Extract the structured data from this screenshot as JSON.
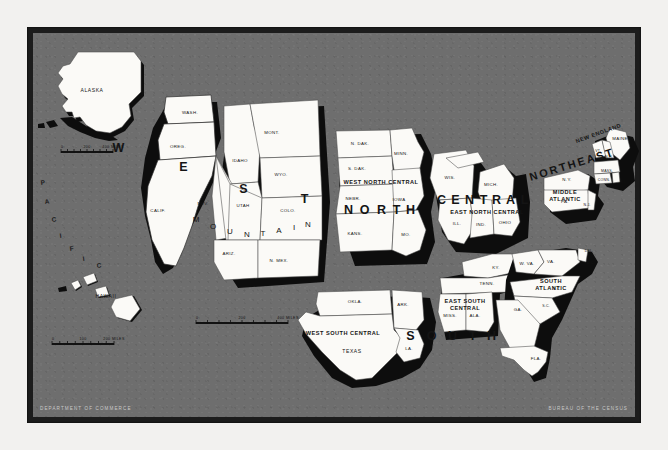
{
  "document": {
    "kind": "map",
    "title": "Census Regions and Divisions of the United States",
    "background_color": "#6e6e6e",
    "frame_color": "#1c1c1c",
    "land_color": "#fbfaf7",
    "shadow_color": "#0d0d0d"
  },
  "credits": {
    "left": "DEPARTMENT OF COMMERCE",
    "right": "BUREAU OF THE CENSUS"
  },
  "ocean_labels": [
    {
      "text": "P",
      "x": 41,
      "y": 185
    },
    {
      "text": "A",
      "x": 45,
      "y": 204
    },
    {
      "text": "C",
      "x": 52,
      "y": 222
    },
    {
      "text": "I",
      "x": 60,
      "y": 238
    },
    {
      "text": "F",
      "x": 70,
      "y": 251
    },
    {
      "text": "I",
      "x": 83,
      "y": 261
    },
    {
      "text": "C",
      "x": 97,
      "y": 268
    }
  ],
  "regions": [
    {
      "name": "WEST",
      "letters": [
        {
          "ch": "W",
          "x": 119,
          "y": 152
        },
        {
          "ch": "E",
          "x": 184,
          "y": 171
        },
        {
          "ch": "S",
          "x": 244,
          "y": 193
        },
        {
          "ch": "T",
          "x": 305,
          "y": 203
        }
      ]
    },
    {
      "name": "NORTH",
      "letters": [
        {
          "ch": "N",
          "x": 349,
          "y": 214
        },
        {
          "ch": "O",
          "x": 365,
          "y": 214
        },
        {
          "ch": "R",
          "x": 382,
          "y": 214
        },
        {
          "ch": "T",
          "x": 397,
          "y": 214
        },
        {
          "ch": "H",
          "x": 411,
          "y": 214
        }
      ]
    },
    {
      "name": "CENTRAL",
      "letters": [
        {
          "ch": "C",
          "x": 442,
          "y": 204
        },
        {
          "ch": "E",
          "x": 456,
          "y": 204
        },
        {
          "ch": "N",
          "x": 470,
          "y": 204
        },
        {
          "ch": "T",
          "x": 484,
          "y": 204
        },
        {
          "ch": "R",
          "x": 497,
          "y": 204
        },
        {
          "ch": "A",
          "x": 511,
          "y": 204
        },
        {
          "ch": "L",
          "x": 525,
          "y": 204
        }
      ]
    },
    {
      "name": "SOUTH",
      "letters": [
        {
          "ch": "S",
          "x": 411,
          "y": 340
        },
        {
          "ch": "O",
          "x": 432,
          "y": 340
        },
        {
          "ch": "U",
          "x": 453,
          "y": 340
        },
        {
          "ch": "T",
          "x": 473,
          "y": 340
        },
        {
          "ch": "H",
          "x": 492,
          "y": 340
        }
      ]
    },
    {
      "name": "NORTHEAST",
      "text": "NORTHEAST",
      "x": 573,
      "y": 168,
      "rotate": -17
    }
  ],
  "divisions": [
    {
      "label": "MOUNTAIN",
      "style": "spaced",
      "letters": [
        {
          "ch": "M",
          "x": 196,
          "y": 222
        },
        {
          "ch": "O",
          "x": 213,
          "y": 229
        },
        {
          "ch": "U",
          "x": 230,
          "y": 234
        },
        {
          "ch": "N",
          "x": 247,
          "y": 237
        },
        {
          "ch": "T",
          "x": 263,
          "y": 236
        },
        {
          "ch": "A",
          "x": 279,
          "y": 233
        },
        {
          "ch": "I",
          "x": 294,
          "y": 230
        },
        {
          "ch": "N",
          "x": 308,
          "y": 227
        }
      ]
    },
    {
      "label": "WEST NORTH CENTRAL",
      "x": 381,
      "y": 184
    },
    {
      "label": "EAST NORTH CENTRAL",
      "x": 487,
      "y": 214
    },
    {
      "label": "WEST SOUTH CENTRAL",
      "x": 343,
      "y": 335
    },
    {
      "label": "EAST SOUTH CENTRAL",
      "x": 465,
      "y": 303,
      "line2": "CENTRAL"
    },
    {
      "label": "SOUTH ATLANTIC",
      "x": 551,
      "y": 283,
      "line2": "ATLANTIC"
    },
    {
      "label": "MIDDLE ATLANTIC",
      "x": 565,
      "y": 194,
      "line2": "ATLANTIC"
    },
    {
      "label": "NEW ENGLAND",
      "x": 599,
      "y": 135,
      "rotate": -20
    },
    {
      "label": "PACIFIC",
      "note": "shown as spaced ocean lettering"
    }
  ],
  "states": [
    {
      "abbr": "ALASKA",
      "x": 92,
      "y": 92
    },
    {
      "abbr": "HAWAII",
      "x": 106,
      "y": 298
    },
    {
      "abbr": "WASH.",
      "x": 190,
      "y": 114
    },
    {
      "abbr": "OREG.",
      "x": 178,
      "y": 148
    },
    {
      "abbr": "CALIF.",
      "x": 158,
      "y": 212
    },
    {
      "abbr": "IDAHO",
      "x": 240,
      "y": 162
    },
    {
      "abbr": "MONT.",
      "x": 272,
      "y": 134
    },
    {
      "abbr": "WYO.",
      "x": 281,
      "y": 176
    },
    {
      "abbr": "NEV.",
      "x": 203,
      "y": 205
    },
    {
      "abbr": "UTAH",
      "x": 243,
      "y": 207
    },
    {
      "abbr": "COLO.",
      "x": 288,
      "y": 212
    },
    {
      "abbr": "ARIZ.",
      "x": 229,
      "y": 255
    },
    {
      "abbr": "N. MEX.",
      "x": 279,
      "y": 262
    },
    {
      "abbr": "N. DAK.",
      "x": 360,
      "y": 145
    },
    {
      "abbr": "S. DAK.",
      "x": 357,
      "y": 170
    },
    {
      "abbr": "NEBR.",
      "x": 353,
      "y": 200
    },
    {
      "abbr": "KANS.",
      "x": 355,
      "y": 235
    },
    {
      "abbr": "MINN.",
      "x": 401,
      "y": 155
    },
    {
      "abbr": "IOWA",
      "x": 399,
      "y": 201
    },
    {
      "abbr": "MO.",
      "x": 406,
      "y": 236
    },
    {
      "abbr": "WIS.",
      "x": 450,
      "y": 179
    },
    {
      "abbr": "MICH.",
      "x": 491,
      "y": 186
    },
    {
      "abbr": "ILL.",
      "x": 457,
      "y": 225
    },
    {
      "abbr": "IND.",
      "x": 481,
      "y": 226
    },
    {
      "abbr": "OHIO",
      "x": 505,
      "y": 224
    },
    {
      "abbr": "OKLA.",
      "x": 355,
      "y": 303
    },
    {
      "abbr": "ARK.",
      "x": 403,
      "y": 306
    },
    {
      "abbr": "TEXAS",
      "x": 352,
      "y": 353
    },
    {
      "abbr": "LA.",
      "x": 409,
      "y": 350
    },
    {
      "abbr": "KY.",
      "x": 496,
      "y": 269
    },
    {
      "abbr": "TENN.",
      "x": 487,
      "y": 285
    },
    {
      "abbr": "MISS.",
      "x": 450,
      "y": 317
    },
    {
      "abbr": "ALA.",
      "x": 475,
      "y": 317
    },
    {
      "abbr": "W. VA.",
      "x": 527,
      "y": 265
    },
    {
      "abbr": "VA.",
      "x": 551,
      "y": 263
    },
    {
      "abbr": "DEL.",
      "x": 589,
      "y": 252
    },
    {
      "abbr": "D.C.",
      "x": 591,
      "y": 264
    },
    {
      "abbr": "N.C.",
      "x": 557,
      "y": 290
    },
    {
      "abbr": "S.C.",
      "x": 546,
      "y": 307
    },
    {
      "abbr": "GA.",
      "x": 518,
      "y": 311
    },
    {
      "abbr": "FLA.",
      "x": 536,
      "y": 360
    },
    {
      "abbr": "N.Y.",
      "x": 567,
      "y": 181
    },
    {
      "abbr": "PA.",
      "x": 565,
      "y": 203
    },
    {
      "abbr": "N.J.",
      "x": 587,
      "y": 206
    },
    {
      "abbr": "MAINE",
      "x": 620,
      "y": 140
    },
    {
      "abbr": "VT.",
      "x": 598,
      "y": 152
    },
    {
      "abbr": "N.H.",
      "x": 609,
      "y": 158
    },
    {
      "abbr": "MASS.",
      "x": 607,
      "y": 172
    },
    {
      "abbr": "CONN.",
      "x": 604,
      "y": 181
    },
    {
      "abbr": "R.I.",
      "x": 623,
      "y": 183
    }
  ],
  "scale_bars": [
    {
      "id": "main",
      "ticks": [
        "0",
        "200",
        "400 MILES"
      ],
      "x": 196,
      "y": 322,
      "width": 92
    },
    {
      "id": "hawaii",
      "ticks": [
        "0",
        "100",
        "200 MILES"
      ],
      "x": 52,
      "y": 343,
      "width": 62
    },
    {
      "id": "alaska",
      "ticks": [
        "0",
        "200",
        "400 MILES"
      ],
      "x": 61,
      "y": 151,
      "width": 52
    }
  ]
}
